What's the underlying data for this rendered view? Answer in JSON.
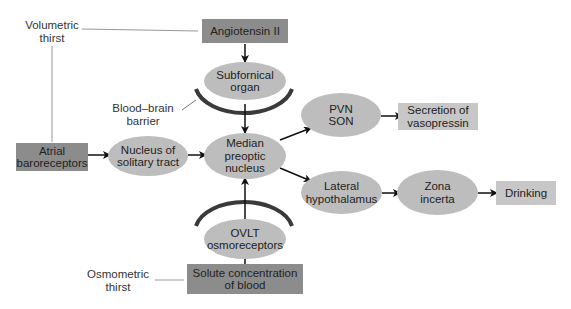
{
  "diagram": {
    "labels": {
      "volumetric_thirst": "Volumetric\nthirst",
      "osmometric_thirst": "Osmometric\nthirst",
      "blood_brain_barrier": "Blood–brain\nbarrier"
    },
    "nodes": {
      "angiotensin": "Angiotensin II",
      "subfornical": "Subfornical\norgan",
      "atrial": "Atrial\nbaroreceptors",
      "nts": "Nucleus of\nsolitary tract",
      "mnpo": "Median\npreoptic\nnucleus",
      "pvn_son": "PVN\nSON",
      "vasopressin": "Secretion of\nvasopressin",
      "lateral_hypo": "Lateral\nhypothalamus",
      "zona_incerta": "Zona\nincerta",
      "drinking": "Drinking",
      "ovlt": "OVLT\nosmoreceptors",
      "solute": "Solute concentration\nof blood"
    },
    "edges": [
      [
        "Angiotensin II",
        "Subfornical organ"
      ],
      [
        "Subfornical organ",
        "Median preoptic nucleus"
      ],
      [
        "Atrial baroreceptors",
        "Nucleus of solitary tract"
      ],
      [
        "Nucleus of solitary tract",
        "Median preoptic nucleus"
      ],
      [
        "Median preoptic nucleus",
        "PVN SON"
      ],
      [
        "PVN SON",
        "Secretion of vasopressin"
      ],
      [
        "Median preoptic nucleus",
        "Lateral hypothalamus"
      ],
      [
        "Lateral hypothalamus",
        "Zona incerta"
      ],
      [
        "Zona incerta",
        "Drinking"
      ],
      [
        "OVLT osmoreceptors",
        "Median preoptic nucleus"
      ],
      [
        "Solute concentration of blood",
        "OVLT osmoreceptors"
      ]
    ],
    "colors": {
      "dark_box": "#8c8c8c",
      "light_box": "#c7c7c7",
      "ellipse": "#bdbdbd",
      "barrier_arc": "#3a3a3a",
      "connector": "#999999"
    }
  }
}
